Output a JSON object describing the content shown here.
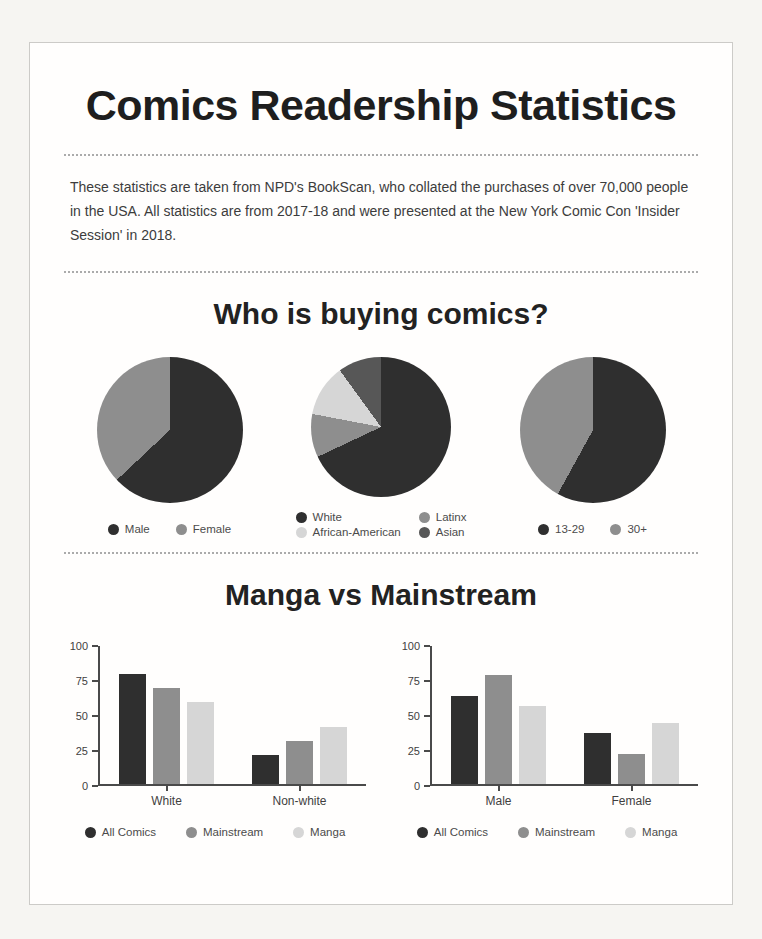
{
  "page": {
    "title": "Comics Readership Statistics",
    "intro": "These statistics are taken from NPD's BookScan, who collated the purchases of over 70,000 people in the USA. All statistics are from 2017-18 and were presented at the New York Comic Con 'Insider Session' in 2018.",
    "section1_title": "Who is buying comics?",
    "section2_title": "Manga vs Mainstream"
  },
  "colors": {
    "dark": "#2f2f2f",
    "gray": "#8e8e8e",
    "light_gray": "#d6d6d6",
    "mid_dark_gray": "#575757",
    "axis": "#4a4a4a",
    "card_background": "#fffefd",
    "page_background": "#f6f5f2"
  },
  "chart_data": [
    {
      "type": "pie",
      "name": "buyers-by-gender",
      "labels": [
        "Male",
        "Female"
      ],
      "values": [
        63,
        37
      ],
      "colors": [
        "#2f2f2f",
        "#8e8e8e"
      ],
      "legend_position": "bottom"
    },
    {
      "type": "pie",
      "name": "buyers-by-ethnicity",
      "labels": [
        "White",
        "Latinx",
        "African-American",
        "Asian"
      ],
      "values": [
        68,
        10,
        12,
        10
      ],
      "colors": [
        "#2f2f2f",
        "#8e8e8e",
        "#d6d6d6",
        "#575757"
      ],
      "legend_position": "bottom"
    },
    {
      "type": "pie",
      "name": "buyers-by-age",
      "labels": [
        "13-29",
        "30+"
      ],
      "values": [
        58,
        42
      ],
      "colors": [
        "#2f2f2f",
        "#8e8e8e"
      ],
      "legend_position": "bottom"
    },
    {
      "type": "bar",
      "name": "manga-vs-mainstream-by-race",
      "categories": [
        "White",
        "Non-white"
      ],
      "series": [
        {
          "name": "All Comics",
          "values": [
            79,
            21
          ]
        },
        {
          "name": "Mainstream",
          "values": [
            69,
            31
          ]
        },
        {
          "name": "Manga",
          "values": [
            59,
            41
          ]
        }
      ],
      "colors": [
        "#2f2f2f",
        "#8e8e8e",
        "#d6d6d6"
      ],
      "ylim": [
        0,
        100
      ],
      "yticks": [
        0,
        25,
        50,
        75,
        100
      ],
      "grid": false,
      "legend_position": "bottom"
    },
    {
      "type": "bar",
      "name": "manga-vs-mainstream-by-gender",
      "categories": [
        "Male",
        "Female"
      ],
      "series": [
        {
          "name": "All Comics",
          "values": [
            63,
            37
          ]
        },
        {
          "name": "Mainstream",
          "values": [
            78,
            22
          ]
        },
        {
          "name": "Manga",
          "values": [
            56,
            44
          ]
        }
      ],
      "colors": [
        "#2f2f2f",
        "#8e8e8e",
        "#d6d6d6"
      ],
      "ylim": [
        0,
        100
      ],
      "yticks": [
        0,
        25,
        50,
        75,
        100
      ],
      "grid": false,
      "legend_position": "bottom"
    }
  ]
}
